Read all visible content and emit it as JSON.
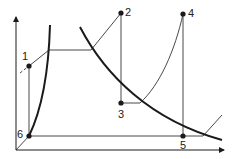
{
  "diagram": {
    "type": "thermodynamic cycle diagram",
    "points": [
      {
        "id": "1",
        "label": "1",
        "x": 29,
        "y": 66,
        "lx": 21,
        "ly": 51
      },
      {
        "id": "2",
        "label": "2",
        "x": 121,
        "y": 13,
        "lx": 125,
        "ly": 7
      },
      {
        "id": "3",
        "label": "3",
        "x": 121,
        "y": 103,
        "lx": 117,
        "ly": 109
      },
      {
        "id": "4",
        "label": "4",
        "x": 183,
        "y": 14,
        "lx": 188,
        "ly": 9
      },
      {
        "id": "5",
        "label": "5",
        "x": 183,
        "y": 136,
        "lx": 179,
        "ly": 140
      },
      {
        "id": "6",
        "label": "6",
        "x": 29,
        "y": 136,
        "lx": 16,
        "ly": 129
      }
    ],
    "colors": {
      "line": "#1a1a1a",
      "background": "#ffffff"
    }
  }
}
